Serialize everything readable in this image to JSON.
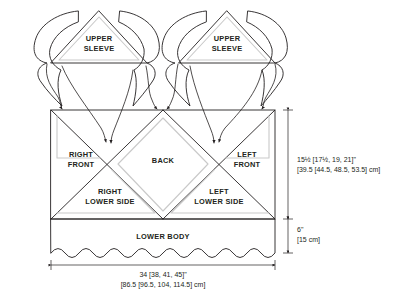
{
  "diagram": {
    "pieces": [
      {
        "id": "upper-sleeve-right",
        "line1": "UPPER",
        "line2": "SLEEVE"
      },
      {
        "id": "upper-sleeve-left",
        "line1": "UPPER",
        "line2": "SLEEVE"
      },
      {
        "id": "right-front",
        "line1": "RIGHT",
        "line2": "FRONT"
      },
      {
        "id": "back",
        "line1": "BACK",
        "line2": ""
      },
      {
        "id": "left-front",
        "line1": "LEFT",
        "line2": "FRONT"
      },
      {
        "id": "right-lower-side",
        "line1": "RIGHT",
        "line2": "LOWER SIDE"
      },
      {
        "id": "left-lower-side",
        "line1": "LEFT",
        "line2": "LOWER SIDE"
      },
      {
        "id": "lower-body",
        "line1": "LOWER BODY",
        "line2": ""
      }
    ],
    "labels": {
      "upper_sleeve_line1": "UPPER",
      "upper_sleeve_line2": "SLEEVE",
      "right_front_line1": "RIGHT",
      "right_front_line2": "FRONT",
      "back": "BACK",
      "left_front_line1": "LEFT",
      "left_front_line2": "FRONT",
      "right_lower_side_line1": "RIGHT",
      "right_lower_side_line2": "LOWER SIDE",
      "left_lower_side_line1": "LEFT",
      "left_lower_side_line2": "LOWER SIDE",
      "lower_body": "LOWER BODY"
    },
    "dimensions": {
      "body_height": {
        "imperial": "15½ [17½, 19, 21]\"",
        "metric": "[39.5 [44.5, 48.5, 53.5] cm]"
      },
      "lower_body_height": {
        "imperial": "6\"",
        "metric": "[15 cm]"
      },
      "width": {
        "imperial": "34 [38, 41, 45]\"",
        "metric": "[86.5 [96.5, 104, 114.5] cm]"
      }
    },
    "colors": {
      "outline": "#231f20",
      "seam_allowance": "#c9c9c9",
      "background": "#ffffff"
    }
  }
}
